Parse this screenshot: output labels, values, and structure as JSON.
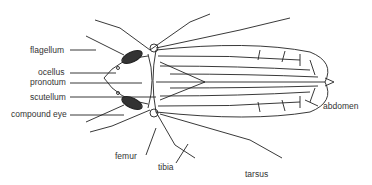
{
  "diagram": {
    "labels": {
      "flagellum": "flagellum",
      "ocellus": "ocellus",
      "pronotum": "pronotum",
      "scutellum": "scutellum",
      "compound_eye": "compound eye",
      "femur": "femur",
      "tibia": "tibia",
      "tarsus": "tarsus",
      "abdomen": "abdomen"
    },
    "colors": {
      "line": "#222222",
      "label": "#333333",
      "background": "#ffffff"
    }
  }
}
